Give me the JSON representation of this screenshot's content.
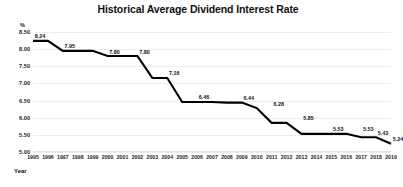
{
  "chart_data": {
    "type": "line",
    "title": "Historical Average Dividend Interest Rate",
    "xlabel": "Year",
    "ylabel": "%",
    "ylim": [
      5.0,
      8.5
    ],
    "ytick_labels": [
      "8.50",
      "8.00",
      "7.50",
      "7.00",
      "6.50",
      "6.00",
      "5.50",
      "5.00"
    ],
    "yticks": [
      8.5,
      8.0,
      7.5,
      7.0,
      6.5,
      6.0,
      5.5,
      5.0
    ],
    "grid": true,
    "legend": "none",
    "line_color": "#000000",
    "categories": [
      "1995",
      "1996",
      "1997",
      "1998",
      "1999",
      "2000",
      "2001",
      "2002",
      "2003",
      "2004",
      "2005",
      "2006",
      "2007",
      "2008",
      "2009",
      "2010",
      "2011",
      "2012",
      "2013",
      "2014",
      "2015",
      "2016",
      "2017",
      "2018",
      "2019"
    ],
    "values": [
      8.24,
      8.24,
      7.95,
      7.95,
      7.95,
      7.8,
      7.8,
      7.8,
      7.16,
      7.16,
      6.46,
      6.46,
      6.46,
      6.44,
      6.44,
      6.28,
      5.85,
      5.85,
      5.53,
      5.53,
      5.53,
      5.53,
      5.43,
      5.43,
      5.24
    ],
    "point_labels": [
      {
        "category": "1995",
        "value": 8.24,
        "text": "8.24"
      },
      {
        "category": "1997",
        "value": 7.95,
        "text": "7.95"
      },
      {
        "category": "2000",
        "value": 7.8,
        "text": "7.80"
      },
      {
        "category": "2002",
        "value": 7.8,
        "text": "7.80"
      },
      {
        "category": "2004",
        "value": 7.16,
        "text": "7.16"
      },
      {
        "category": "2006",
        "value": 6.46,
        "text": "6.46"
      },
      {
        "category": "2009",
        "value": 6.44,
        "text": "6.44"
      },
      {
        "category": "2011",
        "value": 6.28,
        "text": "6.28"
      },
      {
        "category": "2013",
        "value": 5.85,
        "text": "5.85"
      },
      {
        "category": "2015",
        "value": 5.53,
        "text": "5.53"
      },
      {
        "category": "2017",
        "value": 5.53,
        "text": "5.53"
      },
      {
        "category": "2018",
        "value": 5.43,
        "text": "5.43"
      },
      {
        "category": "2019",
        "value": 5.24,
        "text": "5.24"
      }
    ]
  }
}
